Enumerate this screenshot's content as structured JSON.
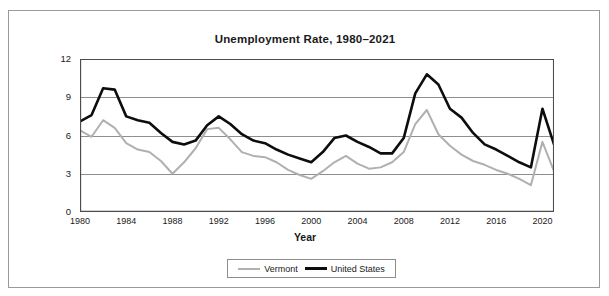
{
  "chart_data": {
    "type": "line",
    "title": "Unemployment Rate, 1980–2021",
    "xlabel": "Year",
    "ylabel": "Percent",
    "ylim": [
      0,
      12
    ],
    "xlim": [
      1980,
      2021
    ],
    "yticks": [
      0,
      3,
      6,
      9,
      12
    ],
    "xticks": [
      1980,
      1984,
      1988,
      1992,
      1996,
      2000,
      2004,
      2008,
      2012,
      2016,
      2020
    ],
    "grid": "horizontal",
    "legend_position": "bottom-center",
    "x": [
      1980,
      1981,
      1982,
      1983,
      1984,
      1985,
      1986,
      1987,
      1988,
      1989,
      1990,
      1991,
      1992,
      1993,
      1994,
      1995,
      1996,
      1997,
      1998,
      1999,
      2000,
      2001,
      2002,
      2003,
      2004,
      2005,
      2006,
      2007,
      2008,
      2009,
      2010,
      2011,
      2012,
      2013,
      2014,
      2015,
      2016,
      2017,
      2018,
      2019,
      2020,
      2021
    ],
    "series": [
      {
        "name": "Vermont",
        "color": "#b0b0b0",
        "values": [
          6.4,
          5.9,
          7.2,
          6.6,
          5.4,
          4.9,
          4.7,
          4.0,
          3.0,
          3.9,
          5.0,
          6.5,
          6.6,
          5.7,
          4.7,
          4.4,
          4.3,
          3.9,
          3.3,
          2.9,
          2.6,
          3.2,
          3.9,
          4.4,
          3.8,
          3.4,
          3.5,
          3.9,
          4.7,
          6.9,
          8.0,
          6.1,
          5.2,
          4.5,
          4.0,
          3.7,
          3.3,
          3.0,
          2.6,
          2.1,
          5.5,
          3.2
        ]
      },
      {
        "name": "United States",
        "color": "#0d0d0d",
        "values": [
          7.1,
          7.6,
          9.7,
          9.6,
          7.5,
          7.2,
          7.0,
          6.2,
          5.5,
          5.3,
          5.6,
          6.8,
          7.5,
          6.9,
          6.1,
          5.6,
          5.4,
          4.9,
          4.5,
          4.2,
          3.9,
          4.7,
          5.8,
          6.0,
          5.5,
          5.1,
          4.6,
          4.6,
          5.8,
          9.3,
          10.8,
          10.0,
          8.1,
          7.4,
          6.2,
          5.3,
          4.9,
          4.4,
          3.9,
          3.5,
          8.1,
          5.3
        ]
      }
    ]
  },
  "legend": {
    "entries": [
      {
        "label": "Vermont"
      },
      {
        "label": "United States"
      }
    ]
  }
}
